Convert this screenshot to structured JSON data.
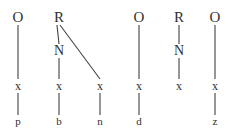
{
  "figure": {
    "type": "syntax-tree-diagram",
    "background_color": "#ffffff",
    "ink_color": "#2f2f2f",
    "edge_color": "#4a4a4a",
    "width": 240,
    "height": 133,
    "tree_count": 5
  },
  "trees": [
    {
      "id": "tree-1",
      "root_label": "O",
      "nodes": [
        {
          "id": "t1-root",
          "label": "O",
          "tier": "root",
          "x": 18,
          "y": 17
        },
        {
          "id": "t1-x",
          "label": "x",
          "tier": "x",
          "x": 18,
          "y": 86
        },
        {
          "id": "t1-leaf",
          "label": "p",
          "tier": "leaf",
          "x": 18,
          "y": 121
        }
      ],
      "edges": [
        {
          "from": "t1-root",
          "to": "t1-x",
          "x1": 18,
          "y1": 25,
          "x2": 18,
          "y2": 79
        },
        {
          "from": "t1-x",
          "to": "t1-leaf",
          "x1": 18,
          "y1": 93,
          "x2": 18,
          "y2": 115
        }
      ]
    },
    {
      "id": "tree-2",
      "root_label": "R",
      "nodes": [
        {
          "id": "t2-root",
          "label": "R",
          "tier": "root",
          "x": 59,
          "y": 17
        },
        {
          "id": "t2-n",
          "label": "N",
          "tier": "mid",
          "x": 59,
          "y": 51
        },
        {
          "id": "t2-x1",
          "label": "x",
          "tier": "x",
          "x": 59,
          "y": 86
        },
        {
          "id": "t2-leaf1",
          "label": "b",
          "tier": "leaf",
          "x": 59,
          "y": 121
        },
        {
          "id": "t2-x2",
          "label": "x",
          "tier": "x",
          "x": 100,
          "y": 86
        },
        {
          "id": "t2-leaf2",
          "label": "n",
          "tier": "leaf",
          "x": 100,
          "y": 121
        }
      ],
      "edges": [
        {
          "from": "t2-root",
          "to": "t2-n",
          "x1": 57,
          "y1": 25,
          "x2": 59,
          "y2": 44
        },
        {
          "from": "t2-n",
          "to": "t2-x1",
          "x1": 59,
          "y1": 58,
          "x2": 59,
          "y2": 79
        },
        {
          "from": "t2-x1",
          "to": "t2-leaf1",
          "x1": 59,
          "y1": 93,
          "x2": 59,
          "y2": 115
        },
        {
          "from": "t2-root",
          "to": "t2-x2",
          "x1": 60,
          "y1": 25,
          "x2": 100,
          "y2": 79
        },
        {
          "from": "t2-x2",
          "to": "t2-leaf2",
          "x1": 100,
          "y1": 93,
          "x2": 100,
          "y2": 115
        }
      ]
    },
    {
      "id": "tree-3",
      "root_label": "O",
      "nodes": [
        {
          "id": "t3-root",
          "label": "O",
          "tier": "root",
          "x": 139,
          "y": 17
        },
        {
          "id": "t3-x",
          "label": "x",
          "tier": "x",
          "x": 139,
          "y": 86
        },
        {
          "id": "t3-leaf",
          "label": "d",
          "tier": "leaf",
          "x": 139,
          "y": 121
        }
      ],
      "edges": [
        {
          "from": "t3-root",
          "to": "t3-x",
          "x1": 139,
          "y1": 25,
          "x2": 139,
          "y2": 79
        },
        {
          "from": "t3-x",
          "to": "t3-leaf",
          "x1": 139,
          "y1": 93,
          "x2": 139,
          "y2": 115
        }
      ]
    },
    {
      "id": "tree-4",
      "root_label": "R",
      "nodes": [
        {
          "id": "t4-root",
          "label": "R",
          "tier": "root",
          "x": 179,
          "y": 17
        },
        {
          "id": "t4-n",
          "label": "N",
          "tier": "mid",
          "x": 179,
          "y": 51
        },
        {
          "id": "t4-x",
          "label": "x",
          "tier": "x",
          "x": 179,
          "y": 86
        }
      ],
      "edges": [
        {
          "from": "t4-root",
          "to": "t4-n",
          "x1": 179,
          "y1": 25,
          "x2": 179,
          "y2": 44
        },
        {
          "from": "t4-n",
          "to": "t4-x",
          "x1": 179,
          "y1": 58,
          "x2": 179,
          "y2": 79
        }
      ]
    },
    {
      "id": "tree-5",
      "root_label": "O",
      "nodes": [
        {
          "id": "t5-root",
          "label": "O",
          "tier": "root",
          "x": 215,
          "y": 17
        },
        {
          "id": "t5-x",
          "label": "x",
          "tier": "x",
          "x": 215,
          "y": 86
        },
        {
          "id": "t5-leaf",
          "label": "z",
          "tier": "leaf",
          "x": 215,
          "y": 121
        }
      ],
      "edges": [
        {
          "from": "t5-root",
          "to": "t5-x",
          "x1": 215,
          "y1": 25,
          "x2": 215,
          "y2": 79
        },
        {
          "from": "t5-x",
          "to": "t5-leaf",
          "x1": 215,
          "y1": 93,
          "x2": 215,
          "y2": 115
        }
      ]
    }
  ]
}
